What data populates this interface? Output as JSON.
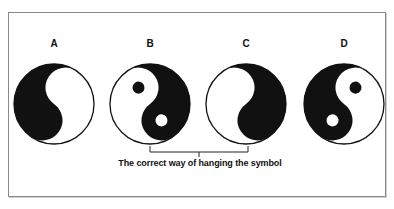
{
  "figure": {
    "symbols": [
      {
        "label": "A",
        "orientation": "black-left-top, white dot top"
      },
      {
        "label": "B",
        "orientation": "white-left-top, black dot top"
      },
      {
        "label": "C",
        "orientation": "black-right-top, white dot top"
      },
      {
        "label": "D",
        "orientation": "white-right-top, black dot top"
      }
    ],
    "bracket_spans": [
      "B",
      "C"
    ],
    "caption": "The correct way of hanging the symbol"
  },
  "colors": {
    "ink": "#111111",
    "paper": "#ffffff",
    "frame": "#8a8a8a"
  }
}
